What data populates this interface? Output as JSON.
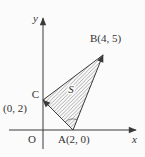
{
  "figure": {
    "type": "coordinate-plane-triangle",
    "axis_labels": {
      "x": "x",
      "y": "y"
    },
    "origin_label": "O",
    "points": [
      {
        "name": "A",
        "label": "A(2, 0)",
        "x": 2,
        "y": 0
      },
      {
        "name": "B",
        "label": "B(4, 5)",
        "x": 4,
        "y": 5
      },
      {
        "name": "C",
        "label": "C",
        "coord_label": "(0, 2)",
        "x": 0,
        "y": 2
      }
    ],
    "region_label": "S",
    "segments": [
      {
        "from": "A",
        "to": "B",
        "arrow": true
      },
      {
        "from": "A",
        "to": "C",
        "arrow": true
      },
      {
        "from": "C",
        "to": "B",
        "arrow": false
      }
    ],
    "shading": "diagonal-hatch",
    "colors": {
      "background": "#fbfbfb",
      "stroke": "#3a3a3a",
      "hatch": "#6b6b6b",
      "ink": "#333333"
    }
  }
}
